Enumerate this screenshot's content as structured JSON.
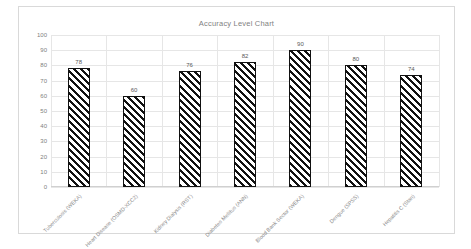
{
  "chart_data": {
    "type": "bar",
    "title": "Accuracy Level Chart",
    "xlabel": "",
    "ylabel": "",
    "ylim": [
      0,
      100
    ],
    "ytick_step": 10,
    "yticks": [
      100,
      90,
      80,
      70,
      60,
      50,
      40,
      30,
      20,
      10,
      0
    ],
    "grid": true,
    "legend": false,
    "categories": [
      "Tuberculosis (WEKA)",
      "Heart Disease (OSMD-XCC2)",
      "Kidney Dialysis (RST)",
      "Diabetes Mellitus (ANN)",
      "Blood Bank Sector (WEKA)",
      "Dengue (SPSS)",
      "Hepatitis C (Stan)"
    ],
    "values": [
      78,
      60,
      76,
      82,
      90,
      80,
      74
    ],
    "data_labels": [
      "78",
      "60",
      "76",
      "82",
      "90",
      "80",
      "74"
    ],
    "bar_style": {
      "fill": "diagonal-hatch",
      "hatch_color": "#111111",
      "background": "#ffffff",
      "outline": "#111111"
    }
  },
  "colors": {
    "figure_border": "#d9d9d9",
    "gridline": "#e6e6e6",
    "title_text": "#7f7f7f",
    "tick_text": "#808080",
    "category_text": "#8c8c8c",
    "label_text": "#595959"
  }
}
